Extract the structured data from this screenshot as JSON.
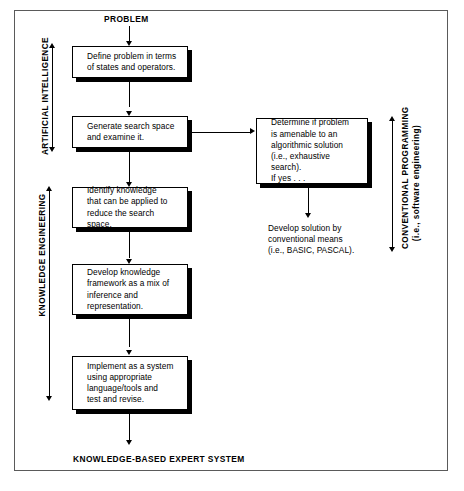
{
  "diagram": {
    "title_top": "PROBLEM",
    "title_bottom": "KNOWLEDGE-BASED EXPERT SYSTEM",
    "span_labels": {
      "artificial_intelligence": "ARTIFICIAL INTELLIGENCE",
      "knowledge_engineering": "KNOWLEDGE ENGINEERING",
      "conventional_programming_line1": "CONVENTIONAL PROGRAMMING",
      "conventional_programming_line2": "(i.e., software engineering)"
    },
    "boxes": [
      {
        "id": "define-problem",
        "text": "Define problem in terms\nof states and operators."
      },
      {
        "id": "generate-search",
        "text": "Generate search space\nand examine it."
      },
      {
        "id": "identify-knowledge",
        "text": "Identify knowledge\nthat can be applied to\nreduce the search space."
      },
      {
        "id": "develop-framework",
        "text": "Develop knowledge\nframework as a mix of\ninference and\nrepresentation."
      },
      {
        "id": "implement-system",
        "text": "Implement as a system\nusing appropriate\nlanguage/tools and\ntest and revise."
      },
      {
        "id": "determine-algorithmic",
        "text": "Determine if problem\nis amenable to an\nalgorithmic solution\n(i.e., exhaustive search).\nIf yes . . ."
      }
    ],
    "captions": [
      {
        "id": "develop-conventional",
        "text": "Develop solution by\nconventional means\n(i.e., BASIC, PASCAL)."
      }
    ],
    "colors": {
      "ink": "#000000",
      "frame": "#5a5a5a",
      "background": "#ffffff"
    }
  }
}
